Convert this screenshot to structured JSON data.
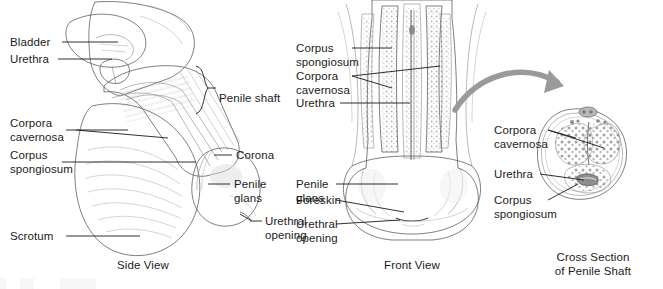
{
  "figure": {
    "background_color": "#ffffff",
    "label_color": "#1b1b1b",
    "art_color": "#5e5e5e",
    "arrow_color": "#9a9a9a"
  },
  "side_view": {
    "caption": "Side View",
    "labels_left": [
      {
        "key": "bladder",
        "text": "Bladder"
      },
      {
        "key": "urethra",
        "text": "Urethra"
      },
      {
        "key": "corpora_cavernosa",
        "line1": "Corpora",
        "line2": "cavernosa"
      },
      {
        "key": "corpus_spongiosum",
        "line1": "Corpus",
        "line2": "spongiosum"
      },
      {
        "key": "scrotum",
        "text": "Scrotum"
      }
    ],
    "labels_right": [
      {
        "key": "penile_shaft",
        "text": "Penile shaft"
      },
      {
        "key": "corona",
        "text": "Corona"
      },
      {
        "key": "penile_glans",
        "line1": "Penile",
        "line2": "glans"
      },
      {
        "key": "urethral_opening",
        "line1": "Urethral",
        "line2": "opening"
      }
    ]
  },
  "front_view": {
    "caption": "Front View",
    "labels": [
      {
        "key": "corpus_spongiosum",
        "line1": "Corpus",
        "line2": "spongiosum"
      },
      {
        "key": "corpora_cavernosa",
        "line1": "Corpora",
        "line2": "cavernosa"
      },
      {
        "key": "urethra",
        "text": "Urethra"
      },
      {
        "key": "penile_glans",
        "line1": "Penile",
        "line2": "glans"
      },
      {
        "key": "foreskin",
        "text": "Foreskin"
      },
      {
        "key": "urethral_opening",
        "line1": "Urethral",
        "line2": "opening"
      }
    ]
  },
  "cross_section": {
    "caption_line1": "Cross Section",
    "caption_line2": "of Penile Shaft",
    "labels": [
      {
        "key": "corpora_cavernosa",
        "line1": "Corpora",
        "line2": "cavernosa"
      },
      {
        "key": "urethra",
        "text": "Urethra"
      },
      {
        "key": "corpus_spongiosum",
        "line1": "Corpus",
        "line2": "spongiosum"
      }
    ]
  }
}
